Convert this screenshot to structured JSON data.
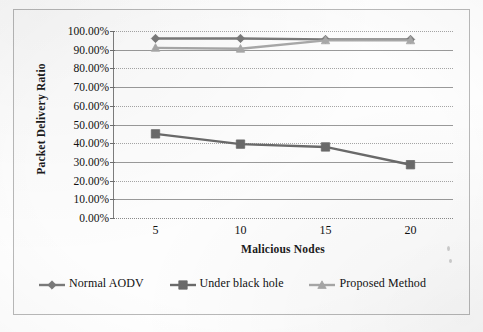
{
  "chart_data": {
    "type": "line",
    "title": "",
    "xlabel": "Malicious Nodes",
    "ylabel": "Packet Delivery Ratio",
    "categories": [
      "5",
      "10",
      "15",
      "20"
    ],
    "x": [
      5,
      10,
      15,
      20
    ],
    "ylim": [
      0,
      100
    ],
    "y_tick_labels": [
      "0.00%",
      "10.00%",
      "20.00%",
      "30.00%",
      "40.00%",
      "50.00%",
      "60.00%",
      "70.00%",
      "80.00%",
      "90.00%",
      "100.00%"
    ],
    "y_tick_values": [
      0,
      10,
      20,
      30,
      40,
      50,
      60,
      70,
      80,
      90,
      100
    ],
    "grid": true,
    "legend_position": "bottom",
    "series": [
      {
        "name": "Normal AODV",
        "marker": "diamond",
        "color": "#7a7a7a",
        "values": [
          96.0,
          96.0,
          95.5,
          95.5
        ]
      },
      {
        "name": "Under black hole",
        "marker": "square",
        "color": "#6a6a6a",
        "values": [
          45.0,
          39.5,
          38.0,
          28.5
        ]
      },
      {
        "name": "Proposed Method",
        "marker": "triangle",
        "color": "#a8a8a8",
        "values": [
          91.0,
          90.5,
          95.0,
          95.0
        ]
      }
    ]
  },
  "legend": {
    "items": [
      {
        "label": "Normal AODV",
        "marker": "diamond",
        "color": "#7a7a7a"
      },
      {
        "label": "Under black hole",
        "marker": "square",
        "color": "#6a6a6a"
      },
      {
        "label": "Proposed Method",
        "marker": "triangle",
        "color": "#a8a8a8"
      }
    ]
  },
  "axes": {
    "y_title": "Packet Delivery Ratio",
    "x_title": "Malicious Nodes"
  },
  "colors": {
    "frame": "#b9b9b9",
    "gridline": "#9a9a9a",
    "axis": "#7d7d7d",
    "text": "#111111"
  }
}
